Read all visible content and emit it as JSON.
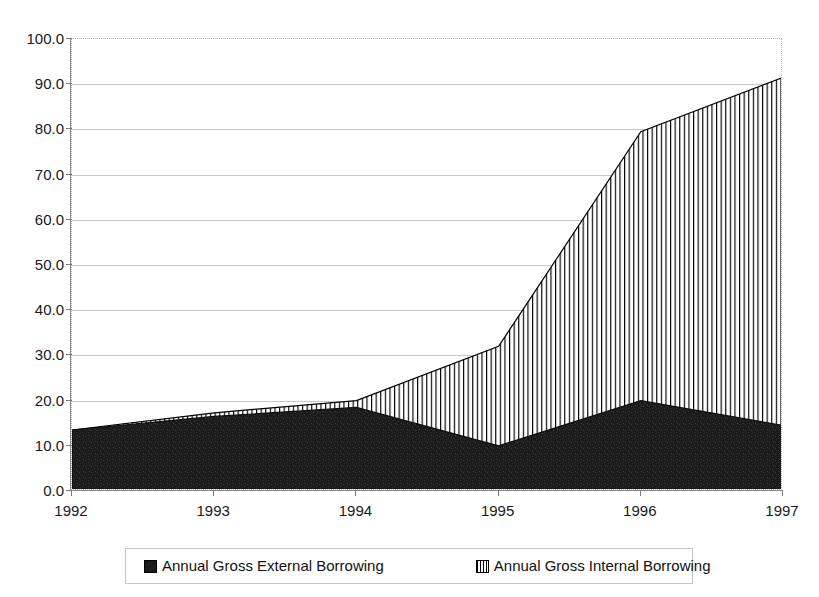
{
  "chart_data": {
    "type": "area",
    "stacked": true,
    "title": "",
    "subtitle": "",
    "xlabel": "",
    "ylabel": "",
    "categories": [
      "1992",
      "1993",
      "1994",
      "1995",
      "1996",
      "1997"
    ],
    "x": [
      1992,
      1993,
      1994,
      1995,
      1996,
      1997
    ],
    "series": [
      {
        "name": "Annual Gross External Borrowing",
        "fill": "solid-dark",
        "color": "#1b1b1b",
        "values": [
          13.5,
          16.5,
          18.5,
          10.0,
          20.0,
          14.5
        ]
      },
      {
        "name": "Annual Gross Internal Borrowing",
        "fill": "vertical-stripes",
        "color": "#ffffff",
        "values": [
          0.0,
          0.8,
          1.5,
          22.0,
          59.5,
          77.0
        ]
      }
    ],
    "totals": [
      13.5,
      17.3,
      20.0,
      32.0,
      79.5,
      91.5
    ],
    "ylim": [
      0.0,
      100.0
    ],
    "ytick_step": 10.0,
    "ytick_labels": [
      "0.0",
      "10.0",
      "20.0",
      "30.0",
      "40.0",
      "50.0",
      "60.0",
      "70.0",
      "80.0",
      "90.0",
      "100.0"
    ],
    "xtick_labels": [
      "1992",
      "1993",
      "1994",
      "1995",
      "1996",
      "1997"
    ],
    "grid": true,
    "grid_axis": "y",
    "legend_position": "bottom",
    "legend_entries": [
      "Annual Gross External Borrowing",
      "Annual Gross Internal Borrowing"
    ],
    "inflection_note": "external borrowing peaks just after 1996 at about 21.0"
  },
  "axes": {
    "y_labels": [
      "100.0",
      "90.0",
      "80.0",
      "70.0",
      "60.0",
      "50.0",
      "40.0",
      "30.0",
      "20.0",
      "10.0",
      "0.0"
    ],
    "x_labels": [
      "1992",
      "1993",
      "1994",
      "1995",
      "1996",
      "1997"
    ]
  },
  "legend": {
    "external": {
      "label": "Annual Gross External Borrowing",
      "swatch": "solid-dark-square-icon",
      "color": "#1b1b1b"
    },
    "internal": {
      "label": "Annual Gross Internal Borrowing",
      "swatch": "vertical-striped-square-icon",
      "color": "#ffffff"
    }
  },
  "top_caption": {
    "text": ""
  }
}
